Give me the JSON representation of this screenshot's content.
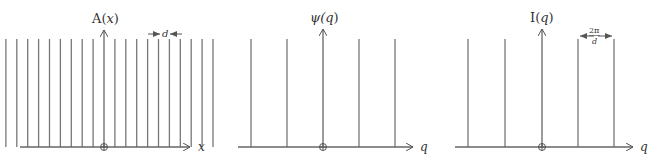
{
  "figure": {
    "panels": [
      {
        "id": "real-space",
        "ylabel": "A(",
        "ylabel_var": "x",
        "ylabel_close": ")",
        "xlabel": "x",
        "spacing_label": "d",
        "origin_symbol": "⊕",
        "spike_count": 21,
        "spike_spacing_px": 10.9,
        "description": "Periodic comb of delta functions in real space with spacing d"
      },
      {
        "id": "amplitude",
        "ylabel": "ψ(",
        "ylabel_var": "q",
        "ylabel_close": ")",
        "xlabel": "q",
        "origin_symbol": "⊕",
        "spike_count": 5,
        "spike_spacing_px": 36,
        "description": "Fourier transform amplitude: comb in reciprocal space"
      },
      {
        "id": "intensity",
        "ylabel": "I(",
        "ylabel_var": "q",
        "ylabel_close": ")",
        "xlabel": "q",
        "spacing_label_num": "2π",
        "spacing_label_den": "d",
        "origin_symbol": "⊕",
        "spike_count": 5,
        "spike_spacing_px": 36.5,
        "description": "Scattered intensity: comb with spacing 2π/d"
      }
    ],
    "colors": {
      "line": "#666666",
      "text": "#333333"
    }
  }
}
